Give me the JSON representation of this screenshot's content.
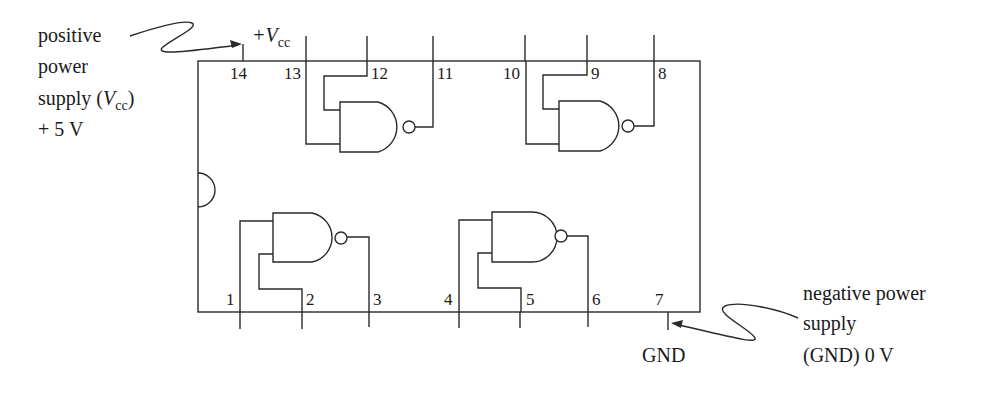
{
  "diagram": {
    "chip": {
      "pins_top": [
        {
          "number": "14",
          "x": 243
        },
        {
          "number": "13",
          "x": 306
        },
        {
          "number": "12",
          "x": 367
        },
        {
          "number": "11",
          "x": 433
        },
        {
          "number": "10",
          "x": 525
        },
        {
          "number": "9",
          "x": 587
        },
        {
          "number": "8",
          "x": 654
        }
      ],
      "pins_bottom": [
        {
          "number": "1",
          "x": 240
        },
        {
          "number": "2",
          "x": 302
        },
        {
          "number": "3",
          "x": 369
        },
        {
          "number": "4",
          "x": 459
        },
        {
          "number": "5",
          "x": 520
        },
        {
          "number": "6",
          "x": 588
        },
        {
          "number": "7",
          "x": 668
        }
      ],
      "gates": [
        {
          "id": "gate-1",
          "inputs": [
            "1",
            "2"
          ],
          "output": "3"
        },
        {
          "id": "gate-2",
          "inputs": [
            "4",
            "5"
          ],
          "output": "6"
        },
        {
          "id": "gate-3",
          "inputs": [
            "13",
            "12"
          ],
          "output": "11"
        },
        {
          "id": "gate-4",
          "inputs": [
            "10",
            "9"
          ],
          "output": "8"
        }
      ]
    },
    "vcc_label": {
      "prefix": "+V",
      "subscript": "cc"
    },
    "gnd_label": "GND",
    "positive_annotation": {
      "lines": [
        "positive",
        "power",
        "supply (",
        "+ 5 V"
      ],
      "line3_var": "V",
      "line3_sub": "cc",
      "line3_close": ")"
    },
    "negative_annotation": {
      "lines": [
        "negative power",
        "supply",
        "(GND) 0 V"
      ]
    },
    "colors": {
      "stroke": "#2a2a2a",
      "text": "#1a1a1a",
      "background": "#ffffff"
    }
  }
}
